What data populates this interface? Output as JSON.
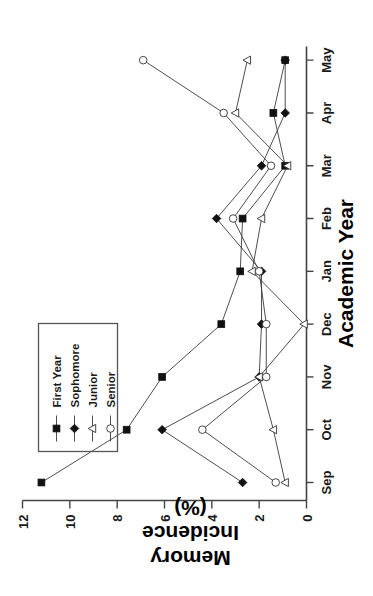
{
  "figure": {
    "orientation_note": "rotated-90-ccw",
    "background": "#ffffff"
  },
  "axes": {
    "x": {
      "title": "Academic Year",
      "ticks": [
        "Sep",
        "Oct",
        "Nov",
        "Dec",
        "Jan",
        "Feb",
        "Mar",
        "Apr",
        "May"
      ]
    },
    "y": {
      "title_line1": "Memory",
      "title_line2": "Incidence",
      "title_line3": "(%)",
      "ticks": [
        "0",
        "2",
        "4",
        "6",
        "8",
        "10",
        "12"
      ]
    }
  },
  "legend": {
    "entries": [
      {
        "label": "First Year",
        "marker": "filled-square",
        "color": "#111111"
      },
      {
        "label": "Sophomore",
        "marker": "filled-diamond",
        "color": "#111111"
      },
      {
        "label": "Junior",
        "marker": "open-triangle",
        "color": "#333333"
      },
      {
        "label": "Senior",
        "marker": "open-circle",
        "color": "#333333"
      }
    ]
  },
  "chart_data": {
    "type": "line",
    "title": "",
    "xlabel": "Academic Year",
    "ylabel": "Memory Incidence (%)",
    "categories": [
      "Sep",
      "Oct",
      "Nov",
      "Dec",
      "Jan",
      "Feb",
      "Mar",
      "Apr",
      "May"
    ],
    "ylim": [
      0,
      12
    ],
    "yticks": [
      0,
      2,
      4,
      6,
      8,
      10,
      12
    ],
    "grid": false,
    "legend_position": "upper-left",
    "series": [
      {
        "name": "First Year",
        "marker": "filled-square",
        "values": [
          11.2,
          7.6,
          6.1,
          3.6,
          2.8,
          2.7,
          0.9,
          1.4,
          0.9
        ]
      },
      {
        "name": "Sophomore",
        "marker": "filled-diamond",
        "values": [
          2.7,
          6.1,
          2.0,
          1.9,
          1.9,
          3.8,
          1.9,
          0.9,
          0.9
        ]
      },
      {
        "name": "Junior",
        "marker": "open-triangle",
        "values": [
          0.9,
          1.4,
          2.0,
          0.1,
          2.3,
          1.9,
          0.8,
          3.0,
          2.5
        ]
      },
      {
        "name": "Senior",
        "marker": "open-circle",
        "values": [
          1.3,
          4.4,
          1.7,
          1.7,
          2.0,
          3.1,
          1.5,
          3.5,
          6.9
        ]
      }
    ]
  }
}
